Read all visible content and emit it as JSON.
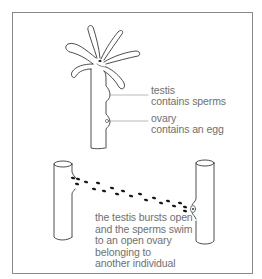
{
  "diagram": {
    "type": "biology-illustration",
    "top_panel": {
      "labels": [
        {
          "name": "testis",
          "title": "testis",
          "desc": "contains sperms"
        },
        {
          "name": "ovary",
          "title": "ovary",
          "desc": "contains an egg"
        }
      ]
    },
    "bottom_panel": {
      "caption_lines": [
        "the testis bursts open",
        "and the sperms swim",
        "to an open ovary",
        "belonging to",
        "another individual"
      ]
    },
    "colors": {
      "line": "#3a3a3a",
      "text": "#6f6f6f",
      "border": "#8a8a8a",
      "sperm": "#1a1a1a"
    }
  }
}
